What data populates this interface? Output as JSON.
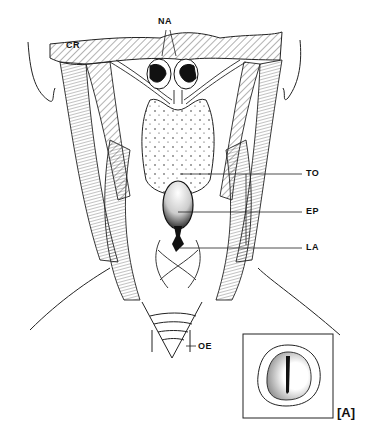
{
  "figure": {
    "panel_label": "[A]",
    "labels": [
      {
        "id": "NA",
        "text": "NA",
        "x": 158,
        "y": 16
      },
      {
        "id": "CR",
        "text": "CR",
        "x": 66,
        "y": 42
      },
      {
        "id": "TO",
        "text": "TO",
        "x": 306,
        "y": 168
      },
      {
        "id": "EP",
        "text": "EP",
        "x": 306,
        "y": 206
      },
      {
        "id": "LA",
        "text": "LA",
        "x": 306,
        "y": 243
      },
      {
        "id": "OE",
        "text": "OE",
        "x": 200,
        "y": 342
      }
    ],
    "colors": {
      "ink": "#111111",
      "background": "#ffffff"
    }
  }
}
